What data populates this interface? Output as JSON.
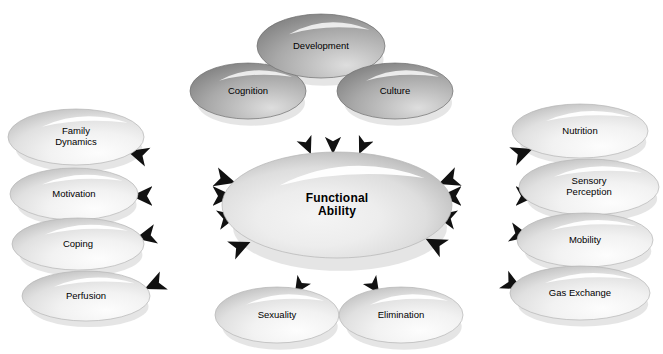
{
  "diagram": {
    "title": "Functional Ability",
    "type": "concept-map",
    "background_color": "#ffffff",
    "colors": {
      "ellipse_light": "#ececec",
      "ellipse_mid": "#b6b6b6",
      "ellipse_dark": "#8d8d8d",
      "ellipse_darker": "#7a7a7a",
      "ellipse_edge": "#9a9a9a",
      "highlight": "#ffffff",
      "arrow_dark": "#1a1a1a",
      "arrow_light": "#d8d8d8",
      "text": "#000000"
    },
    "center": {
      "id": "functional-ability",
      "label": "Functional\nAbility",
      "cx": 337,
      "cy": 205,
      "rx": 115,
      "ry": 53
    },
    "upper_nodes": [
      {
        "id": "cognition",
        "label": "Cognition",
        "cx": 248,
        "cy": 91,
        "rx": 58,
        "ry": 28,
        "shade": "dark"
      },
      {
        "id": "development",
        "label": "Development",
        "cx": 321,
        "cy": 46,
        "rx": 64,
        "ry": 32,
        "shade": "dark"
      },
      {
        "id": "culture",
        "label": "Culture",
        "cx": 395,
        "cy": 91,
        "rx": 58,
        "ry": 28,
        "shade": "dark"
      }
    ],
    "left_nodes": [
      {
        "id": "family-dynamics",
        "label": "Family\nDynamics",
        "cx": 76,
        "cy": 137,
        "rx": 68,
        "ry": 28,
        "shade": "light"
      },
      {
        "id": "motivation",
        "label": "Motivation",
        "cx": 74,
        "cy": 194,
        "rx": 64,
        "ry": 26,
        "shade": "light"
      },
      {
        "id": "coping",
        "label": "Coping",
        "cx": 78,
        "cy": 244,
        "rx": 66,
        "ry": 26,
        "shade": "light"
      },
      {
        "id": "perfusion",
        "label": "Perfusion",
        "cx": 86,
        "cy": 296,
        "rx": 64,
        "ry": 25,
        "shade": "light"
      }
    ],
    "right_nodes": [
      {
        "id": "nutrition",
        "label": "Nutrition",
        "cx": 580,
        "cy": 131,
        "rx": 68,
        "ry": 27,
        "shade": "light"
      },
      {
        "id": "sensory-perception",
        "label": "Sensory\nPerception",
        "cx": 589,
        "cy": 187,
        "rx": 70,
        "ry": 28,
        "shade": "light"
      },
      {
        "id": "mobility",
        "label": "Mobility",
        "cx": 585,
        "cy": 240,
        "rx": 68,
        "ry": 27,
        "shade": "light"
      },
      {
        "id": "gas-exchange",
        "label": "Gas Exchange",
        "cx": 580,
        "cy": 293,
        "rx": 70,
        "ry": 27,
        "shade": "light"
      }
    ],
    "lower_nodes": [
      {
        "id": "sexuality",
        "label": "Sexuality",
        "cx": 277,
        "cy": 315,
        "rx": 62,
        "ry": 28,
        "shade": "light"
      },
      {
        "id": "elimination",
        "label": "Elimination",
        "cx": 401,
        "cy": 315,
        "rx": 62,
        "ry": 28,
        "shade": "light"
      }
    ],
    "connectors": {
      "from_upper_to_center": {
        "style": "single-headed",
        "direction": "into-center",
        "count": 3,
        "arrows": [
          {
            "id": "arrow-cognition-to-center",
            "x1": 292,
            "y1": 110,
            "x2": 310,
            "y2": 152
          },
          {
            "id": "arrow-development-to-center",
            "x1": 333,
            "y1": 104,
            "x2": 333,
            "y2": 152
          },
          {
            "id": "arrow-culture-to-center",
            "x1": 379,
            "y1": 110,
            "x2": 360,
            "y2": 152
          }
        ]
      },
      "center_to_left": {
        "style": "double-headed",
        "direction": "bidirectional",
        "count": 4,
        "arrows": [
          {
            "id": "arrow-center-family-dynamics",
            "x1": 233,
            "y1": 182,
            "x2": 130,
            "y2": 152
          },
          {
            "id": "arrow-center-motivation",
            "x1": 231,
            "y1": 196,
            "x2": 134,
            "y2": 196
          },
          {
            "id": "arrow-center-coping",
            "x1": 236,
            "y1": 216,
            "x2": 138,
            "y2": 238
          },
          {
            "id": "arrow-center-perfusion",
            "x1": 248,
            "y1": 243,
            "x2": 147,
            "y2": 288
          }
        ]
      },
      "center_to_right": {
        "style": "double-headed",
        "direction": "bidirectional",
        "count": 4,
        "arrows": [
          {
            "id": "arrow-center-nutrition",
            "x1": 441,
            "y1": 183,
            "x2": 530,
            "y2": 150
          },
          {
            "id": "arrow-center-sensory-perception",
            "x1": 443,
            "y1": 196,
            "x2": 534,
            "y2": 196
          },
          {
            "id": "arrow-center-mobility",
            "x1": 438,
            "y1": 216,
            "x2": 528,
            "y2": 236
          },
          {
            "id": "arrow-center-gas-exchange",
            "x1": 428,
            "y1": 240,
            "x2": 520,
            "y2": 288
          }
        ]
      },
      "center_to_lower": {
        "style": "single-headed",
        "direction": "out-of-center",
        "count": 2,
        "arrows": [
          {
            "id": "arrow-center-to-sexuality",
            "x1": 318,
            "y1": 258,
            "x2": 296,
            "y2": 292
          },
          {
            "id": "arrow-center-to-elimination",
            "x1": 355,
            "y1": 258,
            "x2": 378,
            "y2": 292
          }
        ]
      }
    }
  }
}
